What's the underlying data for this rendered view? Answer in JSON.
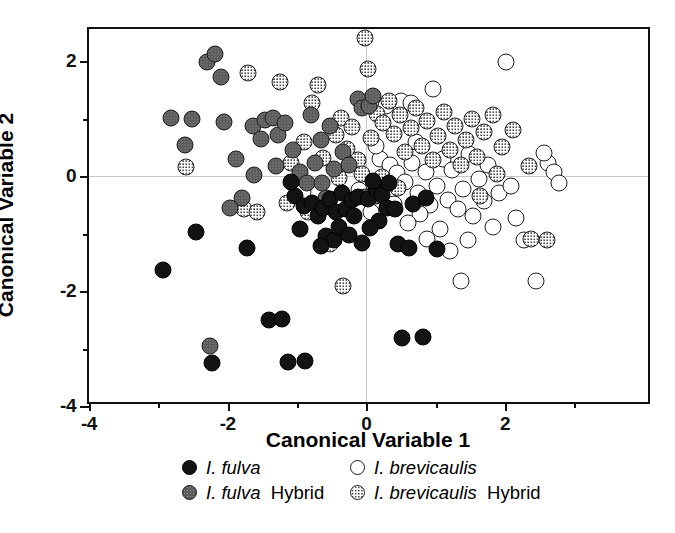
{
  "chart_data": {
    "type": "scatter",
    "title": "",
    "xlabel": "Canonical Variable 1",
    "ylabel": "Canonical Variable 2",
    "xlim": [
      -4,
      4.12
    ],
    "ylim": [
      -4,
      2.56
    ],
    "xticks": [
      -4,
      -2,
      0,
      2
    ],
    "xticklabels": [
      "-4",
      "-2",
      "0",
      "2"
    ],
    "xminorticks": [
      -3,
      -1,
      1,
      3
    ],
    "yticks": [
      2,
      0,
      -2,
      -4
    ],
    "yticklabels": [
      "2",
      "0",
      "-2",
      "-4"
    ],
    "yminorticks": [
      1,
      -1,
      -3
    ],
    "grid": false,
    "zero_reference_lines": true,
    "legend_position": "below-axes",
    "series": [
      {
        "name": "I. fulva",
        "key": "fulva",
        "marker": "filled-black-circle",
        "color": "#131313",
        "points": [
          [
            -2.93,
            -1.63
          ],
          [
            -2.46,
            -0.98
          ],
          [
            -2.22,
            -3.25
          ],
          [
            -1.72,
            -1.25
          ],
          [
            -1.4,
            -2.5
          ],
          [
            -1.22,
            -2.48
          ],
          [
            -1.13,
            -3.23
          ],
          [
            -0.88,
            -3.22
          ],
          [
            -1.03,
            -0.34
          ],
          [
            -0.9,
            -0.52
          ],
          [
            -0.78,
            -0.46
          ],
          [
            -0.7,
            -0.7
          ],
          [
            -0.62,
            -0.55
          ],
          [
            -0.52,
            -0.4
          ],
          [
            -0.44,
            -0.62
          ],
          [
            -0.35,
            -0.3
          ],
          [
            -0.3,
            -0.58
          ],
          [
            -0.58,
            -1.05
          ],
          [
            -0.47,
            -1.12
          ],
          [
            -0.66,
            -1.22
          ],
          [
            -0.4,
            -0.88
          ],
          [
            -0.2,
            -0.42
          ],
          [
            -0.12,
            -0.36
          ],
          [
            0.02,
            -0.4
          ],
          [
            0.14,
            -0.22
          ],
          [
            0.22,
            -0.32
          ],
          [
            0.33,
            -0.12
          ],
          [
            0.3,
            -0.55
          ],
          [
            0.42,
            -0.58
          ],
          [
            0.18,
            -0.78
          ],
          [
            0.05,
            -0.9
          ],
          [
            0.46,
            -1.18
          ],
          [
            0.62,
            -1.25
          ],
          [
            0.52,
            -2.82
          ],
          [
            0.82,
            -2.8
          ],
          [
            -0.06,
            -1.16
          ],
          [
            0.68,
            -0.48
          ],
          [
            0.86,
            -0.38
          ],
          [
            -0.25,
            -1.02
          ],
          [
            -1.08,
            -0.1
          ],
          [
            -0.95,
            -0.92
          ],
          [
            0.1,
            -0.08
          ],
          [
            -0.18,
            -0.7
          ],
          [
            1.02,
            -1.26
          ]
        ]
      },
      {
        "name": "I. fulva Hybrid",
        "key": "fulva_hyb",
        "marker": "gray-stippled-circle",
        "color": "#5b5b5b",
        "points": [
          [
            -2.82,
            1.02
          ],
          [
            -2.62,
            0.55
          ],
          [
            -2.3,
            1.98
          ],
          [
            -2.18,
            2.12
          ],
          [
            -2.1,
            1.72
          ],
          [
            -2.06,
            0.95
          ],
          [
            -1.88,
            0.3
          ],
          [
            -1.8,
            -0.38
          ],
          [
            -1.64,
            0.88
          ],
          [
            -1.52,
            0.65
          ],
          [
            -1.46,
            0.98
          ],
          [
            -1.34,
            1.02
          ],
          [
            -1.28,
            0.72
          ],
          [
            -1.18,
            0.92
          ],
          [
            -1.06,
            0.45
          ],
          [
            -0.96,
            0.08
          ],
          [
            -0.86,
            -0.12
          ],
          [
            -0.74,
            0.22
          ],
          [
            -0.66,
            0.62
          ],
          [
            -0.58,
            -0.38
          ],
          [
            -0.46,
            0.12
          ],
          [
            -0.34,
            0.42
          ],
          [
            -0.12,
            1.35
          ],
          [
            -0.06,
            1.18
          ],
          [
            0.04,
            1.22
          ],
          [
            0.1,
            1.4
          ],
          [
            -0.02,
            -0.36
          ],
          [
            0.14,
            -0.34
          ],
          [
            -1.62,
            0.02
          ],
          [
            -1.3,
            0.18
          ],
          [
            -0.8,
            1.06
          ],
          [
            -0.52,
            0.88
          ],
          [
            -2.52,
            1.0
          ],
          [
            -1.96,
            -0.56
          ],
          [
            -0.64,
            -0.12
          ],
          [
            -0.25,
            0.2
          ],
          [
            -2.25,
            -2.95
          ]
        ]
      },
      {
        "name": "I. brevicaulis",
        "key": "brev",
        "marker": "open-white-circle",
        "color": "#ffffff",
        "points": [
          [
            -0.92,
            -0.28
          ],
          [
            -0.1,
            -0.24
          ],
          [
            0.2,
            0.3
          ],
          [
            0.34,
            0.2
          ],
          [
            0.44,
            0.05
          ],
          [
            0.56,
            -0.1
          ],
          [
            0.66,
            0.22
          ],
          [
            0.74,
            -0.3
          ],
          [
            0.86,
            0.08
          ],
          [
            0.92,
            -0.5
          ],
          [
            1.02,
            -0.18
          ],
          [
            1.1,
            0.3
          ],
          [
            1.18,
            -0.42
          ],
          [
            1.24,
            0.1
          ],
          [
            1.32,
            -0.58
          ],
          [
            1.4,
            -0.22
          ],
          [
            1.48,
            0.38
          ],
          [
            1.54,
            -0.7
          ],
          [
            1.62,
            -0.05
          ],
          [
            1.7,
            -0.44
          ],
          [
            1.76,
            0.2
          ],
          [
            1.82,
            -0.88
          ],
          [
            1.92,
            -0.3
          ],
          [
            2.02,
            1.98
          ],
          [
            2.08,
            -0.18
          ],
          [
            2.16,
            -0.72
          ],
          [
            2.28,
            -1.12
          ],
          [
            2.44,
            -1.82
          ],
          [
            2.62,
            0.22
          ],
          [
            2.7,
            0.08
          ],
          [
            2.78,
            -0.12
          ],
          [
            1.36,
            -1.82
          ],
          [
            0.5,
            1.3
          ],
          [
            0.64,
            1.28
          ],
          [
            0.28,
            1.22
          ],
          [
            0.96,
            1.52
          ],
          [
            0.4,
            -0.48
          ],
          [
            0.78,
            -0.66
          ],
          [
            0.6,
            -0.82
          ],
          [
            1.06,
            -0.92
          ],
          [
            0.88,
            -1.1
          ],
          [
            1.2,
            -1.3
          ],
          [
            1.46,
            -1.12
          ],
          [
            0.14,
            0.52
          ],
          [
            0.06,
            -0.62
          ],
          [
            2.56,
            0.4
          ],
          [
            0.72,
            0.6
          ]
        ]
      },
      {
        "name": "I. brevicaulis Hybrid",
        "key": "brev_hyb",
        "marker": "white-stippled-circle",
        "color": "#ffffff",
        "points": [
          [
            -2.6,
            0.16
          ],
          [
            -1.76,
            -0.58
          ],
          [
            -1.7,
            1.8
          ],
          [
            -1.24,
            1.64
          ],
          [
            -1.08,
            0.22
          ],
          [
            -0.9,
            0.6
          ],
          [
            -0.78,
            1.28
          ],
          [
            -0.7,
            1.58
          ],
          [
            -0.62,
            0.32
          ],
          [
            -0.44,
            0.72
          ],
          [
            -0.36,
            1.02
          ],
          [
            -0.28,
            0.48
          ],
          [
            -0.2,
            0.86
          ],
          [
            -0.12,
            0.28
          ],
          [
            -0.02,
            2.4
          ],
          [
            0.06,
            0.66
          ],
          [
            0.16,
            1.08
          ],
          [
            0.24,
            0.92
          ],
          [
            0.32,
            1.3
          ],
          [
            0.4,
            0.74
          ],
          [
            0.48,
            1.06
          ],
          [
            0.56,
            0.42
          ],
          [
            0.64,
            0.84
          ],
          [
            0.72,
            1.18
          ],
          [
            0.8,
            0.52
          ],
          [
            0.88,
            0.96
          ],
          [
            0.96,
            0.28
          ],
          [
            1.04,
            0.7
          ],
          [
            1.12,
            1.12
          ],
          [
            1.2,
            0.46
          ],
          [
            1.28,
            0.88
          ],
          [
            1.36,
            0.2
          ],
          [
            1.44,
            0.62
          ],
          [
            1.52,
            1.0
          ],
          [
            1.6,
            0.34
          ],
          [
            1.7,
            0.76
          ],
          [
            1.82,
            1.06
          ],
          [
            1.96,
            0.5
          ],
          [
            2.12,
            0.8
          ],
          [
            2.34,
            0.18
          ],
          [
            2.6,
            -1.12
          ],
          [
            2.38,
            -1.1
          ],
          [
            -1.58,
            -0.62
          ],
          [
            -0.52,
            -1.18
          ],
          [
            -0.34,
            -1.92
          ],
          [
            0.02,
            1.86
          ],
          [
            -0.06,
            0.04
          ],
          [
            0.22,
            -0.02
          ],
          [
            -1.14,
            -0.46
          ],
          [
            -0.84,
            -0.62
          ],
          [
            -0.4,
            -0.04
          ],
          [
            1.64,
            -0.34
          ],
          [
            0.46,
            -0.2
          ],
          [
            1.88,
            0.04
          ]
        ]
      }
    ]
  },
  "legend": {
    "rows": [
      [
        {
          "marker": "fulva",
          "species": "I. fulva",
          "suffix": ""
        },
        {
          "marker": "brev",
          "species": "I. brevicaulis",
          "suffix": ""
        }
      ],
      [
        {
          "marker": "fulva_hyb",
          "species": "I. fulva",
          "suffix": "Hybrid"
        },
        {
          "marker": "brev_hyb",
          "species": "I. brevicaulis",
          "suffix": "Hybrid"
        }
      ]
    ]
  }
}
